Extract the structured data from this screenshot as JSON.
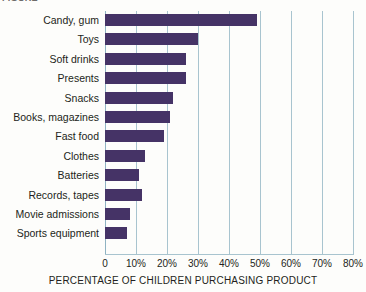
{
  "clipped_header_text": "FIGURE",
  "chart_data": {
    "type": "bar",
    "orientation": "horizontal",
    "title": "",
    "xlabel": "PERCENTAGE OF CHILDREN PURCHASING PRODUCT",
    "ylabel": "",
    "xlim": [
      0,
      80
    ],
    "xtick_labels": [
      "0",
      "10%",
      "20%",
      "30%",
      "40%",
      "50%",
      "60%",
      "70%",
      "80%"
    ],
    "xticks": [
      0,
      10,
      20,
      30,
      40,
      50,
      60,
      70,
      80
    ],
    "grid": "vertical",
    "legend": "none",
    "bar_color": "#453366",
    "gridline_color": "#a8c4cf",
    "background_color": "#fdfdfb",
    "categories": [
      "Candy, gum",
      "Toys",
      "Soft drinks",
      "Presents",
      "Snacks",
      "Books, magazines",
      "Fast food",
      "Clothes",
      "Batteries",
      "Records, tapes",
      "Movie admissions",
      "Sports equipment"
    ],
    "values": [
      49,
      30,
      26,
      26,
      22,
      21,
      19,
      13,
      11,
      12,
      8,
      7
    ]
  }
}
